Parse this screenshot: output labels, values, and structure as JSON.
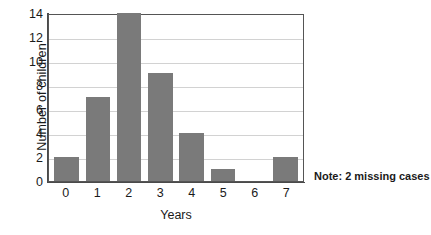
{
  "chart_data": {
    "type": "bar",
    "title": "",
    "xlabel": "Years",
    "ylabel": "Number of children",
    "categories": [
      "0",
      "1",
      "2",
      "3",
      "4",
      "5",
      "6",
      "7"
    ],
    "values": [
      2,
      7,
      14,
      9,
      4,
      1,
      0,
      2
    ],
    "ylim": [
      0,
      14
    ],
    "yticks": [
      "0",
      "2",
      "4",
      "6",
      "8",
      "10",
      "12",
      "14"
    ],
    "ytick_values": [
      0,
      2,
      4,
      6,
      8,
      10,
      12,
      14
    ],
    "grid": "horizontal",
    "legend": "none",
    "annotations": [
      "Note: 2 missing cases"
    ],
    "bar_color": "#7a7a7a",
    "grid_color": "#d2d2d2",
    "axis_color": "#4a4a4a",
    "background": "#ffffff"
  },
  "note": {
    "text": "Note: 2 missing cases"
  }
}
